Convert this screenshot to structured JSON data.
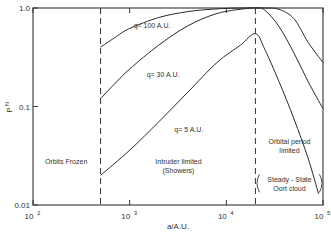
{
  "chart_data": {
    "type": "line",
    "title": "",
    "xlabel": "a/A.U.",
    "ylabel": "P_N",
    "xscale": "log",
    "yscale": "log",
    "xlim": [
      100,
      100000
    ],
    "ylim": [
      0.01,
      1.0
    ],
    "grid": false,
    "x_ticks": [
      {
        "value": 100,
        "label": "10",
        "exp": "2"
      },
      {
        "value": 1000,
        "label": "10",
        "exp": "3"
      },
      {
        "value": 10000,
        "label": "10",
        "exp": "4"
      },
      {
        "value": 100000,
        "label": "10",
        "exp": "5"
      }
    ],
    "y_ticks": [
      {
        "value": 1.0,
        "label": "1.0"
      },
      {
        "value": 0.1,
        "label": "0.1"
      },
      {
        "value": 0.01,
        "label": "0.01"
      }
    ],
    "vlines": [
      {
        "x": 500,
        "style": "dashed"
      },
      {
        "x": 20000,
        "style": "dashed"
      }
    ],
    "series": [
      {
        "name": "q = 100 A.U.",
        "label_pos": {
          "x": 1100,
          "y": 0.62
        },
        "points": [
          [
            500,
            0.4
          ],
          [
            700,
            0.5
          ],
          [
            1000,
            0.62
          ],
          [
            2000,
            0.8
          ],
          [
            4000,
            0.92
          ],
          [
            8000,
            0.98
          ],
          [
            15000,
            1.0
          ],
          [
            25000,
            1.0
          ],
          [
            35000,
            0.97
          ],
          [
            50000,
            0.78
          ],
          [
            70000,
            0.45
          ],
          [
            100000,
            0.28
          ]
        ]
      },
      {
        "name": "q = 30 A.U.",
        "label_pos": {
          "x": 1500,
          "y": 0.2
        },
        "points": [
          [
            500,
            0.12
          ],
          [
            700,
            0.17
          ],
          [
            1000,
            0.24
          ],
          [
            2000,
            0.42
          ],
          [
            4000,
            0.66
          ],
          [
            8000,
            0.88
          ],
          [
            15000,
            0.98
          ],
          [
            20000,
            1.0
          ],
          [
            25000,
            0.95
          ],
          [
            35000,
            0.65
          ],
          [
            50000,
            0.35
          ],
          [
            70000,
            0.18
          ],
          [
            100000,
            0.095
          ]
        ]
      },
      {
        "name": "q = 5 A.U.",
        "label_pos": {
          "x": 2900,
          "y": 0.055
        },
        "points": [
          [
            500,
            0.02
          ],
          [
            1000,
            0.036
          ],
          [
            2000,
            0.07
          ],
          [
            4000,
            0.14
          ],
          [
            8000,
            0.28
          ],
          [
            14000,
            0.42
          ],
          [
            20000,
            0.55
          ],
          [
            25000,
            0.38
          ],
          [
            35000,
            0.18
          ],
          [
            50000,
            0.075
          ],
          [
            70000,
            0.03
          ],
          [
            90000,
            0.013
          ]
        ]
      }
    ],
    "annotations": [
      {
        "lines": [
          "Orbits  Frozen"
        ],
        "x": 220,
        "y": 0.026
      },
      {
        "lines": [
          "Intruder  limited",
          "(Showers)"
        ],
        "x": 3200,
        "y": 0.026
      },
      {
        "lines": [
          "Orbital  period",
          "limited"
        ],
        "x": 45000,
        "y": 0.042
      },
      {
        "lines": [
          "Steady - State",
          "Oort  cloud"
        ],
        "x": 45000,
        "y": 0.017,
        "bracketed": true
      }
    ]
  }
}
